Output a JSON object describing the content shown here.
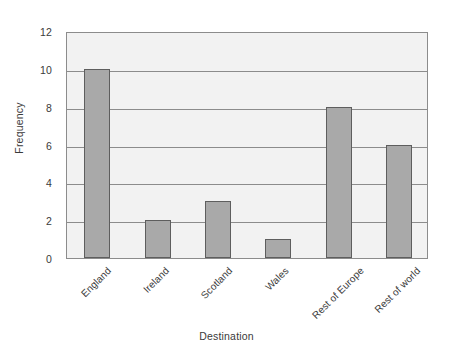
{
  "chart_data": {
    "type": "bar",
    "title": "",
    "xlabel": "Destination",
    "ylabel": "Frequency",
    "categories": [
      "England",
      "Ireland",
      "Scotland",
      "Wales",
      "Rest of Europe",
      "Rest of world"
    ],
    "values": [
      10,
      2,
      3,
      1,
      8,
      6
    ],
    "ylim": [
      0,
      12
    ],
    "yticks": [
      0,
      2,
      4,
      6,
      8,
      10,
      12
    ],
    "ytick_labels": [
      "0",
      "2",
      "4",
      "6",
      "8",
      "10",
      "12"
    ],
    "grid": true,
    "grid_axis": "y",
    "legend": false,
    "legend_position": "none",
    "bar_color": "#a9a9a9",
    "bar_edge_color": "#5e5e5e",
    "plot_background": "#f2f2f2",
    "figure_background": "#ffffff",
    "axis_color": "#8c8c8c",
    "text_color": "#3a3a3a",
    "xtick_rotation": -45
  }
}
